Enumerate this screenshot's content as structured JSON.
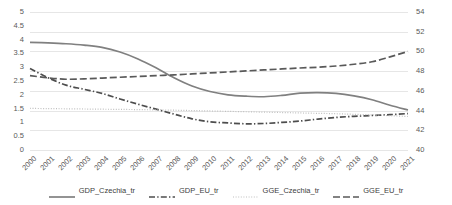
{
  "chart_data": {
    "type": "line",
    "title": "",
    "xlabel": "",
    "ylabel": "",
    "grid": true,
    "legend_position": "bottom",
    "x": [
      "2000",
      "2001",
      "2002",
      "2003",
      "2004",
      "2005",
      "2006",
      "2007",
      "2008",
      "2009",
      "2010",
      "2011",
      "2012",
      "2013",
      "2014",
      "2015",
      "2016",
      "2017",
      "2018",
      "2019",
      "2020",
      "2021"
    ],
    "axes": {
      "left": {
        "label": "",
        "ylim": [
          0,
          5
        ],
        "step": 0.5,
        "ticks": [
          "0",
          "0.5",
          "1",
          "1.5",
          "2",
          "2.5",
          "3",
          "3.5",
          "4",
          "4.5",
          "5"
        ],
        "tick_labels_shown": [
          "5",
          "4.5",
          "4",
          "3.5",
          "3",
          "2.5",
          "2",
          "1.5",
          "1",
          "0.5",
          "0"
        ]
      },
      "right": {
        "label": "",
        "ylim": [
          40,
          54
        ],
        "step": 2,
        "ticks": [
          "40",
          "42",
          "44",
          "46",
          "48",
          "50",
          "52",
          "54"
        ],
        "tick_labels_shown": [
          "54",
          "52",
          "50",
          "48",
          "46",
          "44",
          "42",
          "40"
        ]
      }
    },
    "series": [
      {
        "name": "GDP_Czechia_tr",
        "axis": "left",
        "style": "solid",
        "color": "#808080",
        "values": [
          3.9,
          3.88,
          3.85,
          3.8,
          3.72,
          3.55,
          3.3,
          2.98,
          2.62,
          2.32,
          2.12,
          2.0,
          1.95,
          1.93,
          1.98,
          2.06,
          2.08,
          2.05,
          1.96,
          1.82,
          1.62,
          1.45
        ]
      },
      {
        "name": "GDP_EU_tr",
        "axis": "left",
        "style": "dash-dot",
        "color": "#4d4d4d",
        "values": [
          2.95,
          2.62,
          2.35,
          2.2,
          2.05,
          1.85,
          1.66,
          1.48,
          1.3,
          1.13,
          1.02,
          0.98,
          0.95,
          0.96,
          1.0,
          1.05,
          1.12,
          1.18,
          1.22,
          1.25,
          1.28,
          1.32
        ]
      },
      {
        "name": "GGE_Czechia_tr",
        "axis": "right",
        "style": "dotted",
        "color": "#bfbfbf",
        "values": [
          44.22,
          44.2,
          44.18,
          44.16,
          44.14,
          44.12,
          44.1,
          44.07,
          44.04,
          44.0,
          43.96,
          43.92,
          43.88,
          43.84,
          43.8,
          43.76,
          43.72,
          43.68,
          43.62,
          43.56,
          43.48,
          43.4
        ]
      },
      {
        "name": "GGE_EU_tr",
        "axis": "right",
        "style": "dashed",
        "color": "#595959",
        "values": [
          47.55,
          47.32,
          47.18,
          47.22,
          47.3,
          47.38,
          47.46,
          47.54,
          47.62,
          47.72,
          47.82,
          47.92,
          48.02,
          48.12,
          48.22,
          48.32,
          48.4,
          48.52,
          48.7,
          48.95,
          49.45,
          50.0
        ]
      }
    ],
    "legend": [
      {
        "label": "GDP_Czechia_tr",
        "style": "solid",
        "color": "#808080"
      },
      {
        "label": "GDP_EU_tr",
        "style": "dash-dot",
        "color": "#4d4d4d"
      },
      {
        "label": "GGE_Czechia_tr",
        "style": "dotted",
        "color": "#bfbfbf"
      },
      {
        "label": "GGE_EU_tr",
        "style": "dashed",
        "color": "#595959"
      }
    ]
  }
}
